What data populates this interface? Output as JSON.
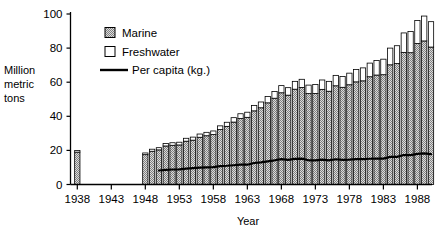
{
  "chart_data": {
    "type": "bar",
    "title": "",
    "subtitle": "",
    "xlabel": "Year",
    "ylabel": "Million metric tons",
    "ylabel_lines": [
      "Million",
      "metric",
      "tons"
    ],
    "xlim": [
      1937.0,
      1990.0
    ],
    "ylim": [
      0,
      100
    ],
    "y_ticks": [
      0,
      20,
      40,
      60,
      80,
      100
    ],
    "x_ticks": [
      1938,
      1943,
      1948,
      1953,
      1958,
      1963,
      1968,
      1973,
      1978,
      1983,
      1988
    ],
    "x_tick_labels": [
      "1938",
      "1943",
      "1948",
      "1953",
      "1958",
      "1963",
      "1968",
      "1973",
      "1978",
      "1983",
      "1988"
    ],
    "y_tick_labels": [
      "0",
      "20",
      "40",
      "60",
      "80",
      "100"
    ],
    "grid": false,
    "stacked": true,
    "legend_position": "upper-left-inside",
    "legend": [
      {
        "label": "Marine",
        "marker": "filled-hatch-square",
        "color": "#b4b4b4"
      },
      {
        "label": "Freshwater",
        "marker": "open-square",
        "color": "#ffffff"
      },
      {
        "label": "Per capita (kg.)",
        "marker": "line",
        "color": "#000000"
      }
    ],
    "secondary_axis_note": "Per capita line plotted on same scale as bars",
    "categories": [
      1938,
      1948,
      1949,
      1950,
      1951,
      1952,
      1953,
      1954,
      1955,
      1956,
      1957,
      1958,
      1959,
      1960,
      1961,
      1962,
      1963,
      1964,
      1965,
      1966,
      1967,
      1968,
      1969,
      1970,
      1971,
      1972,
      1973,
      1974,
      1975,
      1976,
      1977,
      1978,
      1979,
      1980,
      1981,
      1982,
      1983,
      1984,
      1985,
      1986,
      1987,
      1988,
      1989,
      1990
    ],
    "series": [
      {
        "name": "Marine",
        "values": [
          19.0,
          17.5,
          19.5,
          20.3,
          22.6,
          23.0,
          23.2,
          25.4,
          26.0,
          27.7,
          28.6,
          29.3,
          32.2,
          34.1,
          36.6,
          38.7,
          39.4,
          43.2,
          45.0,
          47.9,
          50.6,
          53.8,
          52.4,
          55.9,
          56.9,
          53.3,
          53.4,
          55.8,
          54.7,
          57.9,
          57.0,
          58.5,
          60.2,
          60.8,
          63.2,
          64.2,
          64.4,
          70.2,
          70.9,
          77.5,
          77.3,
          82.7,
          84.2,
          80.6
        ],
        "color": "#b4b4b4",
        "pattern": "checker"
      },
      {
        "name": "Freshwater",
        "values": [
          0.9,
          1.0,
          1.2,
          1.3,
          1.4,
          1.5,
          1.6,
          1.7,
          1.8,
          1.9,
          2.0,
          2.1,
          2.2,
          2.4,
          2.6,
          2.8,
          3.0,
          3.2,
          3.4,
          3.7,
          4.0,
          4.2,
          4.4,
          4.6,
          4.8,
          5.0,
          5.2,
          5.5,
          5.8,
          6.1,
          6.4,
          6.8,
          7.2,
          7.6,
          8.0,
          8.5,
          9.1,
          9.8,
          10.5,
          11.4,
          12.4,
          13.5,
          14.6,
          14.9
        ],
        "color": "#ffffff",
        "pattern": "open"
      }
    ],
    "line_series": {
      "name": "Per capita (kg.)",
      "x": [
        1950,
        1951,
        1952,
        1953,
        1954,
        1955,
        1956,
        1957,
        1958,
        1959,
        1960,
        1961,
        1962,
        1963,
        1964,
        1965,
        1966,
        1967,
        1968,
        1969,
        1970,
        1971,
        1972,
        1973,
        1974,
        1975,
        1976,
        1977,
        1978,
        1979,
        1980,
        1981,
        1982,
        1983,
        1984,
        1985,
        1986,
        1987,
        1988,
        1989,
        1990
      ],
      "values": [
        8.2,
        8.6,
        8.8,
        8.9,
        9.3,
        9.6,
        9.9,
        10.1,
        10.2,
        10.8,
        11.0,
        11.3,
        11.6,
        11.6,
        12.6,
        13.0,
        13.6,
        14.2,
        14.9,
        14.4,
        15.0,
        15.2,
        14.2,
        14.2,
        14.6,
        14.2,
        14.8,
        14.4,
        14.6,
        14.9,
        14.9,
        15.1,
        15.2,
        15.2,
        16.2,
        16.2,
        17.3,
        17.2,
        18.0,
        18.3,
        17.8
      ],
      "color": "#000000",
      "width": 2.2
    },
    "notes": [
      "World War II years (1939-1947) have no data; bars are absent between 1938 and 1948."
    ]
  }
}
